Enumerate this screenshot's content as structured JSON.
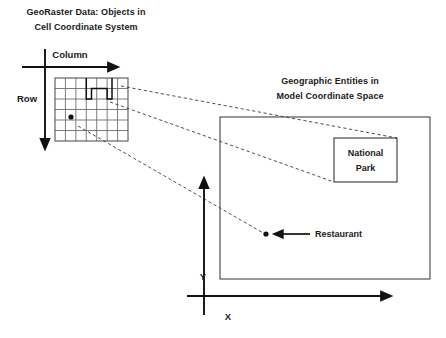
{
  "figure": {
    "title_left_line1": "GeoRaster Data: Objects in",
    "title_left_line2": "Cell Coordinate System",
    "title_right_line1": "Geographic Entities in",
    "title_right_line2": "Model Coordinate Space"
  },
  "left_panel": {
    "axis_column_label": "Column",
    "axis_row_label": "Row",
    "grid": {
      "columns": 7,
      "rows": 6,
      "x": 55,
      "y": 78,
      "width": 73,
      "height": 63
    },
    "region_cells_label": "national-park-cells",
    "point_cell_label": "restaurant-cell"
  },
  "right_panel": {
    "axis_x_label": "X",
    "axis_y_label": "Y",
    "national_park_line1": "National",
    "national_park_line2": "Park",
    "restaurant_label": "Restaurant"
  },
  "colors": {
    "ink": "#111111",
    "grid": "#6e6e6e",
    "dashed": "#3b3b3b",
    "background": "#ffffff"
  }
}
